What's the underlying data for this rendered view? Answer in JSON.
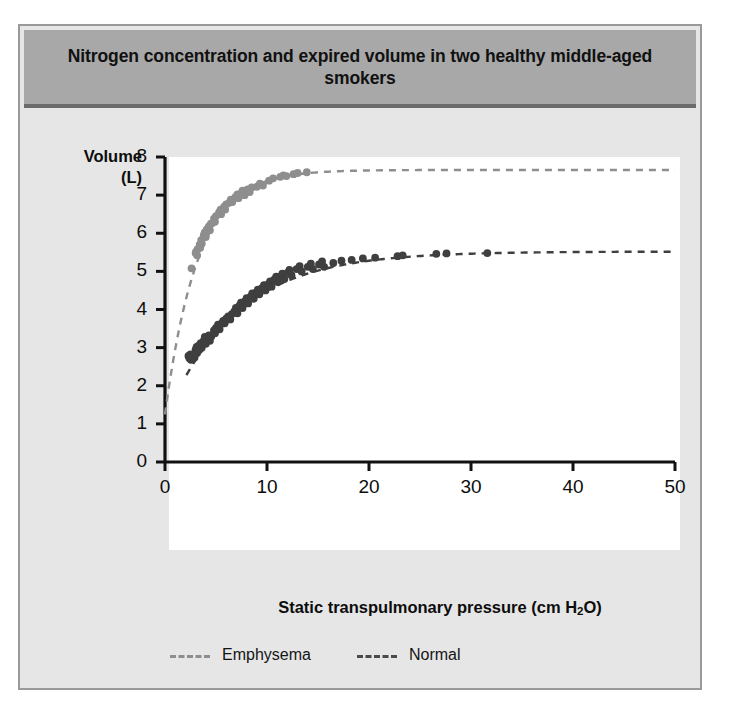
{
  "figure": {
    "title": "Nitrogen concentration and expired volume in two healthy middle-aged smokers"
  },
  "chart_data": {
    "type": "scatter",
    "title": "Nitrogen concentration and expired volume in two healthy middle-aged smokers",
    "xlabel": "Static transpulmonary pressure (cm H2O)",
    "xlabel_pre": "Static transpulmonary pressure (cm H",
    "xlabel_sub": "2",
    "xlabel_post": "O)",
    "ylabel_line1": "Volume",
    "ylabel_line2": "(L)",
    "xlim": [
      0,
      50
    ],
    "ylim": [
      0,
      8
    ],
    "xticks": [
      0,
      10,
      20,
      30,
      40,
      50
    ],
    "yticks": [
      0,
      1,
      2,
      3,
      4,
      5,
      6,
      7,
      8
    ],
    "grid": false,
    "legend_position": "bottom",
    "colors": {
      "emphysema": "#8e8e8e",
      "normal": "#3f3f3f",
      "title_band": "#a8a8a8",
      "panel_bg": "#e6e6e6",
      "plot_bg": "#ffffff",
      "axis": "#111111"
    },
    "series": [
      {
        "name": "Emphysema",
        "marker": "filled-circle",
        "color": "#8e8e8e",
        "line_style": "dashed",
        "fit_curve": {
          "model": "exponential-plateau",
          "y0": 1.25,
          "plateau": 7.66,
          "rate": 0.31,
          "x_start": 0,
          "x_end": 50
        },
        "points": [
          [
            2.6,
            5.08
          ],
          [
            3.0,
            5.48
          ],
          [
            3.05,
            5.52
          ],
          [
            3.15,
            5.42
          ],
          [
            3.2,
            5.58
          ],
          [
            3.4,
            5.7
          ],
          [
            3.45,
            5.62
          ],
          [
            3.55,
            5.82
          ],
          [
            3.6,
            5.74
          ],
          [
            3.8,
            5.95
          ],
          [
            3.9,
            6.02
          ],
          [
            4.0,
            5.9
          ],
          [
            4.1,
            6.1
          ],
          [
            4.3,
            6.18
          ],
          [
            4.4,
            6.08
          ],
          [
            4.5,
            6.25
          ],
          [
            4.8,
            6.38
          ],
          [
            4.9,
            6.3
          ],
          [
            5.0,
            6.45
          ],
          [
            5.3,
            6.55
          ],
          [
            5.45,
            6.62
          ],
          [
            5.5,
            6.5
          ],
          [
            5.8,
            6.7
          ],
          [
            5.9,
            6.62
          ],
          [
            6.0,
            6.76
          ],
          [
            6.3,
            6.8
          ],
          [
            6.45,
            6.88
          ],
          [
            6.6,
            6.82
          ],
          [
            6.9,
            6.95
          ],
          [
            7.1,
            7.02
          ],
          [
            7.2,
            6.92
          ],
          [
            7.5,
            7.05
          ],
          [
            7.6,
            7.12
          ],
          [
            7.8,
            7.0
          ],
          [
            8.1,
            7.15
          ],
          [
            8.3,
            7.08
          ],
          [
            8.5,
            7.2
          ],
          [
            9.0,
            7.22
          ],
          [
            9.3,
            7.3
          ],
          [
            9.6,
            7.25
          ],
          [
            10.2,
            7.38
          ],
          [
            10.6,
            7.44
          ],
          [
            11.3,
            7.48
          ],
          [
            11.6,
            7.52
          ],
          [
            11.9,
            7.5
          ],
          [
            12.6,
            7.55
          ],
          [
            13.0,
            7.58
          ],
          [
            13.9,
            7.6
          ]
        ]
      },
      {
        "name": "Normal",
        "marker": "filled-circle",
        "color": "#3f3f3f",
        "line_style": "dashed",
        "fit_curve": {
          "model": "exponential-plateau",
          "y0": 2.28,
          "plateau": 5.52,
          "rate": 0.145,
          "x_start": 2.1,
          "x_end": 50
        },
        "points": [
          [
            2.3,
            2.78
          ],
          [
            2.4,
            2.72
          ],
          [
            2.5,
            2.82
          ],
          [
            2.55,
            2.68
          ],
          [
            2.65,
            2.76
          ],
          [
            2.7,
            2.7
          ],
          [
            2.8,
            2.8
          ],
          [
            2.9,
            2.74
          ],
          [
            3.0,
            2.95
          ],
          [
            3.1,
            3.02
          ],
          [
            3.15,
            2.86
          ],
          [
            3.3,
            3.05
          ],
          [
            3.4,
            2.96
          ],
          [
            3.5,
            3.12
          ],
          [
            3.6,
            3.0
          ],
          [
            3.8,
            3.18
          ],
          [
            3.9,
            3.28
          ],
          [
            4.0,
            3.1
          ],
          [
            4.15,
            3.22
          ],
          [
            4.3,
            3.32
          ],
          [
            4.4,
            3.18
          ],
          [
            4.55,
            3.3
          ],
          [
            4.8,
            3.45
          ],
          [
            4.9,
            3.38
          ],
          [
            5.0,
            3.52
          ],
          [
            5.2,
            3.6
          ],
          [
            5.35,
            3.48
          ],
          [
            5.5,
            3.62
          ],
          [
            5.7,
            3.7
          ],
          [
            5.85,
            3.64
          ],
          [
            6.0,
            3.76
          ],
          [
            6.2,
            3.82
          ],
          [
            6.4,
            3.74
          ],
          [
            6.55,
            3.88
          ],
          [
            6.8,
            3.95
          ],
          [
            6.95,
            4.04
          ],
          [
            7.1,
            3.9
          ],
          [
            7.3,
            4.1
          ],
          [
            7.45,
            4.18
          ],
          [
            7.6,
            4.04
          ],
          [
            7.85,
            4.22
          ],
          [
            8.0,
            4.3
          ],
          [
            8.15,
            4.16
          ],
          [
            8.4,
            4.34
          ],
          [
            8.55,
            4.42
          ],
          [
            8.7,
            4.28
          ],
          [
            8.95,
            4.45
          ],
          [
            9.1,
            4.52
          ],
          [
            9.25,
            4.4
          ],
          [
            9.5,
            4.56
          ],
          [
            9.7,
            4.64
          ],
          [
            9.85,
            4.5
          ],
          [
            10.1,
            4.66
          ],
          [
            10.3,
            4.74
          ],
          [
            10.45,
            4.6
          ],
          [
            10.7,
            4.78
          ],
          [
            10.9,
            4.86
          ],
          [
            11.05,
            4.72
          ],
          [
            11.3,
            4.86
          ],
          [
            11.5,
            4.94
          ],
          [
            11.7,
            4.8
          ],
          [
            12.0,
            4.96
          ],
          [
            12.2,
            5.04
          ],
          [
            12.4,
            4.9
          ],
          [
            12.9,
            5.06
          ],
          [
            13.2,
            5.14
          ],
          [
            13.4,
            5.0
          ],
          [
            14.0,
            5.12
          ],
          [
            14.3,
            5.2
          ],
          [
            14.5,
            5.06
          ],
          [
            15.1,
            5.18
          ],
          [
            15.4,
            5.26
          ],
          [
            15.6,
            5.12
          ],
          [
            16.5,
            5.22
          ],
          [
            17.3,
            5.28
          ],
          [
            18.3,
            5.3
          ],
          [
            19.4,
            5.34
          ],
          [
            20.6,
            5.36
          ],
          [
            22.8,
            5.4
          ],
          [
            23.3,
            5.42
          ],
          [
            26.6,
            5.46
          ],
          [
            27.6,
            5.47
          ],
          [
            31.6,
            5.48
          ]
        ]
      }
    ]
  },
  "legend": {
    "entries": [
      {
        "label": "Emphysema",
        "color": "#8e8e8e"
      },
      {
        "label": "Normal",
        "color": "#3f3f3f"
      }
    ]
  },
  "axes": {
    "y_title_line1": "Volume",
    "y_title_line2": "(L)",
    "y_tick_labels": [
      "8",
      "7",
      "6",
      "5",
      "4",
      "3",
      "2",
      "1",
      "0"
    ],
    "x_tick_labels": [
      "0",
      "10",
      "20",
      "30",
      "40",
      "50"
    ],
    "x_title_pre": "Static transpulmonary pressure (cm H",
    "x_title_sub": "2",
    "x_title_post": "O)"
  }
}
